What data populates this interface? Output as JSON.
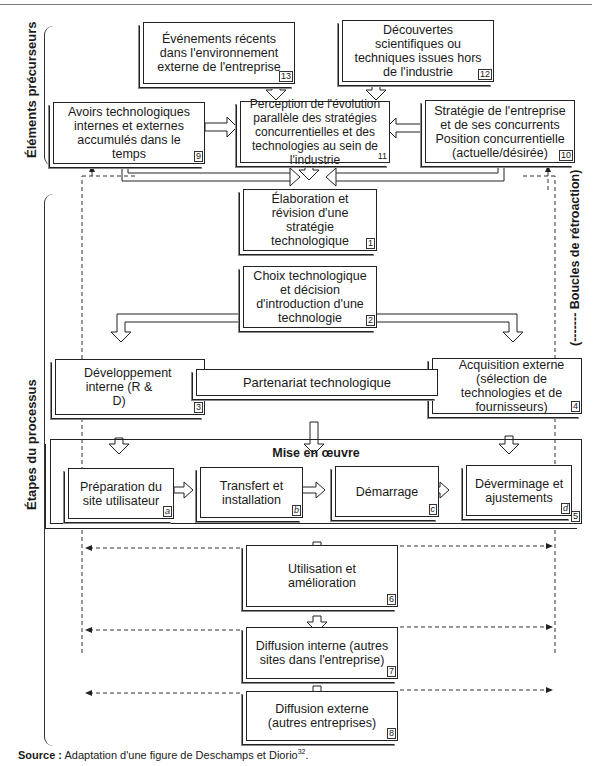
{
  "labels": {
    "precursors": "Éléments précurseurs",
    "process_steps": "Étapes du processus",
    "feedback": "(------- Boucles de rétroaction)"
  },
  "boxes": {
    "b13": {
      "text": "Événements récents dans l'environnement externe de l'entreprise",
      "num": "13"
    },
    "b12": {
      "text": "Découvertes scientifiques ou techniques issues hors de l'industrie",
      "num": "12"
    },
    "b9": {
      "text": "Avoirs technologiques internes et externes accumulés dans le temps",
      "num": "9"
    },
    "b11": {
      "text": "Perception de l'évolution parallèle des stratégies concurrentielles et des technologies au sein de l'industrie",
      "num": "11"
    },
    "b10": {
      "text": "Stratégie de l'entreprise et de ses concurrents Position concurrentielle (actuelle/désirée)",
      "num": "10"
    },
    "b1": {
      "text": "Élaboration et révision d'une stratégie technologique",
      "num": "1"
    },
    "b2": {
      "text": "Choix technologique et décision d'introduction d'une technologie",
      "num": "2"
    },
    "b3": {
      "text": "Développement interne (R & D)",
      "num": "3"
    },
    "partner": {
      "text": "Partenariat technologique"
    },
    "b4": {
      "text": "Acquisition externe (sélection de technologies et de fournisseurs)",
      "num": "4"
    },
    "b5": {
      "title": "Mise en œuvre",
      "num": "5"
    },
    "ba": {
      "text": "Préparation du site utilisateur",
      "num": "a"
    },
    "bb": {
      "text": "Transfert et installation",
      "num": "b"
    },
    "bc": {
      "text": "Démarrage",
      "num": "c"
    },
    "bd": {
      "text": "Déverminage et ajustements",
      "num": "d"
    },
    "b6": {
      "text": "Utilisation et amélioration",
      "num": "6"
    },
    "b7": {
      "text": "Diffusion interne (autres sites dans l'entreprise)",
      "num": "7"
    },
    "b8": {
      "text": "Diffusion externe (autres entreprises)",
      "num": "8"
    }
  },
  "source": {
    "label": "Source :",
    "text": " Adaptation d'une figure de Deschamps et Diorio",
    "sup": "32",
    "end": "."
  }
}
